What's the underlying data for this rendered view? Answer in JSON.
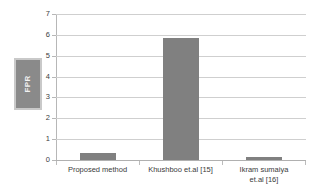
{
  "chart_data": {
    "type": "bar",
    "title": "",
    "xlabel": "",
    "ylabel": "FPR",
    "categories": [
      "Proposed method",
      "Khushboo et.al [15]",
      "Ikram sumaiya et.al [16]"
    ],
    "category_lines": [
      [
        "Proposed method"
      ],
      [
        "Khushboo et.al [15]"
      ],
      [
        "Ikram sumaiya",
        "et.al [16]"
      ]
    ],
    "values": [
      0.35,
      5.85,
      0.15
    ],
    "ylim": [
      0,
      7
    ],
    "yticks": [
      0,
      1,
      2,
      3,
      4,
      5,
      6,
      7
    ],
    "ytick_labels": [
      "0",
      "1",
      "2",
      "3",
      "4",
      "5",
      "6",
      "7"
    ],
    "grid": true,
    "legend": false,
    "legend_position": "none",
    "series": [
      {
        "name": "FPR",
        "values": [
          0.35,
          5.85,
          0.15
        ]
      }
    ],
    "colors": {
      "bar": "#808080",
      "gridline": "#cfcfcf",
      "axis": "#b7b7b7",
      "axis_title_box": "#8a8a8a",
      "axis_title_box_border": "#c9c9c9",
      "axis_title_text": "#f2f2f2",
      "tick_text": "#404040",
      "background": "#ffffff"
    }
  }
}
